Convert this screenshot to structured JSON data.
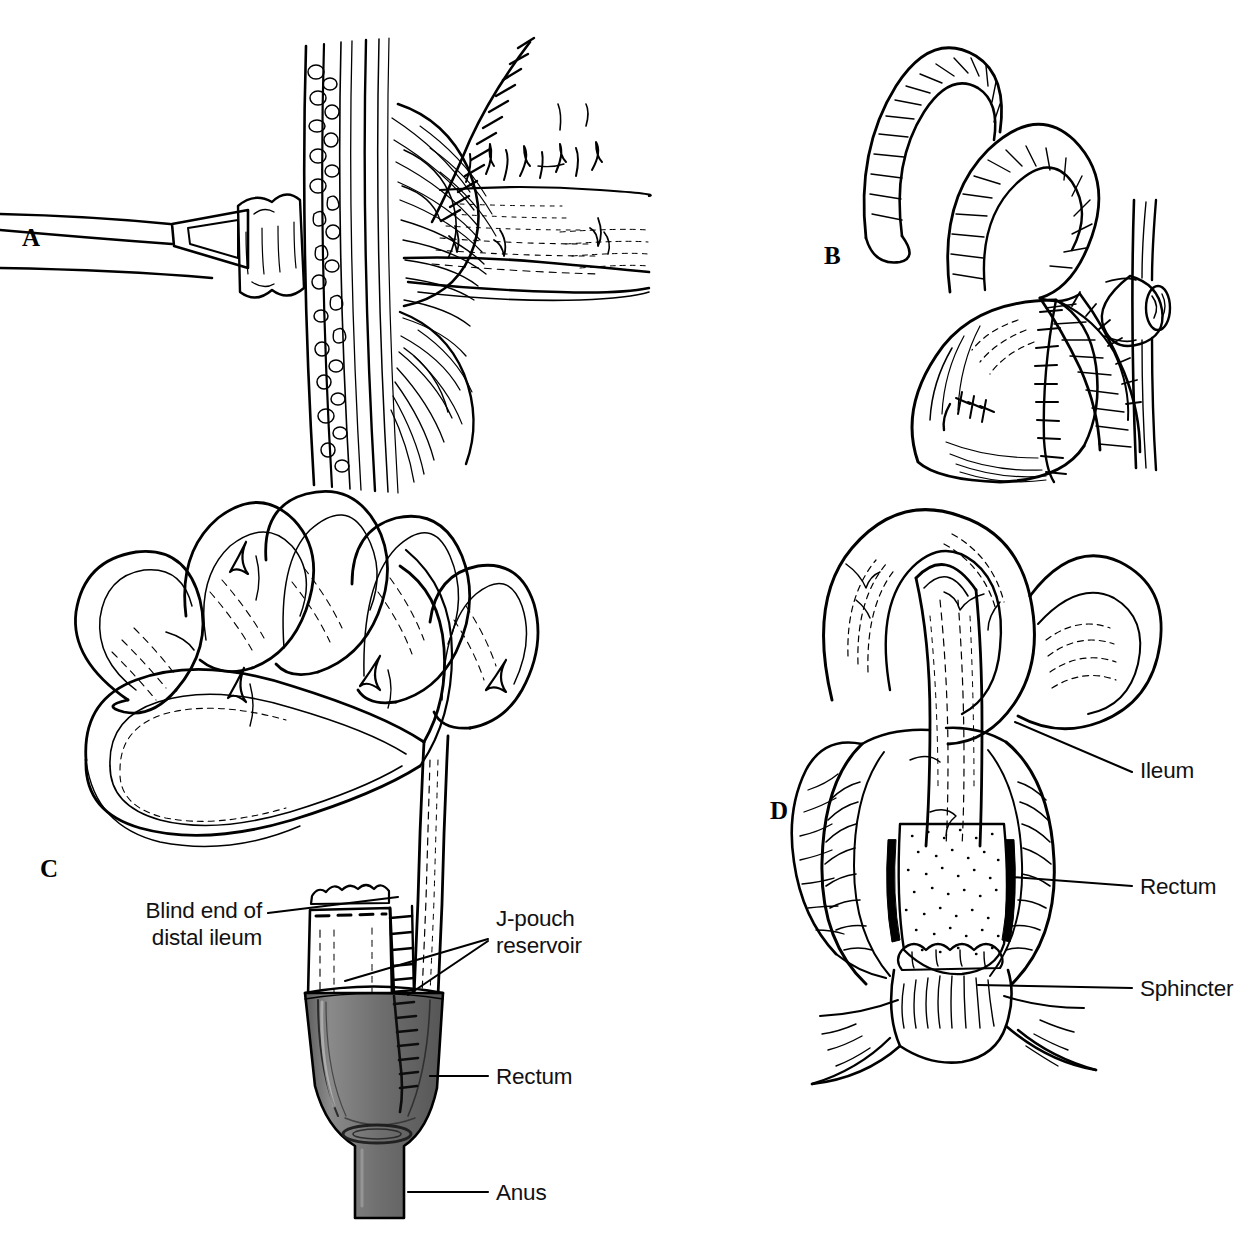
{
  "figure": {
    "background_color": "#ffffff",
    "ink_color": "#000000",
    "rectum_shade_color": "#6e6e6e",
    "width": 1249,
    "height": 1243
  },
  "panels": [
    {
      "id": "A",
      "letter": "A",
      "letter_x": 22,
      "letter_y": 224,
      "caption": "Continent ileostomy nipple valve brought through the abdominal wall with suture line",
      "content_name": "panel-a-illustration"
    },
    {
      "id": "B",
      "letter": "B",
      "letter_x": 824,
      "letter_y": 242,
      "caption": "Kock continent ileal reservoir with suture line and efferent limb at abdominal wall",
      "content_name": "panel-b-illustration"
    },
    {
      "id": "C",
      "letter": "C",
      "letter_x": 40,
      "letter_y": 855,
      "caption": "Small bowel loops with J-pouch reservoir anastomosed into the rectum and anus",
      "content_name": "panel-c-illustration"
    },
    {
      "id": "D",
      "letter": "D",
      "letter_x": 770,
      "letter_y": 797,
      "caption": "Ileum pulled through the rectal cuff to the sphincter complex",
      "content_name": "panel-d-illustration"
    }
  ],
  "labels": [
    {
      "id": "blind-end-distal-ileum",
      "text": "Blind end of\ndistal ileum",
      "panel": "C",
      "align": "right",
      "x": 112,
      "y": 898,
      "width": 150,
      "leaders": [
        [
          268,
          913,
          398,
          897
        ]
      ]
    },
    {
      "id": "j-pouch-reservoir",
      "text": "J-pouch\nreservoir",
      "panel": "C",
      "align": "left",
      "x": 496,
      "y": 906,
      "width": 140,
      "leaders": [
        [
          488,
          939,
          345,
          981
        ],
        [
          488,
          941,
          408,
          995
        ]
      ]
    },
    {
      "id": "rectum-c",
      "text": "Rectum",
      "panel": "C",
      "align": "left",
      "x": 496,
      "y": 1064,
      "width": 120,
      "leaders": [
        [
          488,
          1076,
          430,
          1076
        ]
      ]
    },
    {
      "id": "anus-c",
      "text": "Anus",
      "panel": "C",
      "align": "left",
      "x": 496,
      "y": 1180,
      "width": 100,
      "leaders": [
        [
          488,
          1192,
          408,
          1192
        ]
      ]
    },
    {
      "id": "ileum-d",
      "text": "Ileum",
      "panel": "D",
      "align": "left",
      "x": 1140,
      "y": 758,
      "width": 100,
      "leaders": [
        [
          1132,
          772,
          1015,
          722
        ]
      ]
    },
    {
      "id": "rectum-d",
      "text": "Rectum",
      "panel": "D",
      "align": "left",
      "x": 1140,
      "y": 874,
      "width": 120,
      "leaders": [
        [
          1132,
          886,
          1012,
          877
        ]
      ]
    },
    {
      "id": "sphincter-d",
      "text": "Sphincter",
      "panel": "D",
      "align": "left",
      "x": 1140,
      "y": 976,
      "width": 140,
      "leaders": [
        [
          1132,
          988,
          978,
          985
        ]
      ]
    }
  ]
}
